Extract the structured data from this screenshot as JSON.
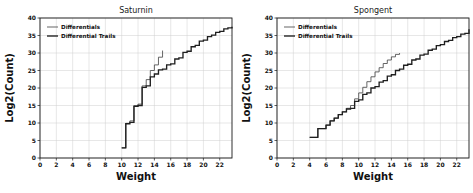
{
  "figure": {
    "background": "#ffffff",
    "line_color_differentials": "#4a4a4a",
    "line_color_trails": "#1f1f1f",
    "grid_color": "#cfcfcf"
  },
  "charts": [
    {
      "id": "saturnin",
      "title": "Saturnin",
      "xlabel": "Weight",
      "ylabel": "Log2(Count)",
      "legend": [
        "Differentials",
        "Differential Trails"
      ],
      "xticks": [
        0,
        2,
        4,
        6,
        8,
        10,
        12,
        14,
        16,
        18,
        20,
        22
      ],
      "yticks": [
        0,
        5,
        10,
        15,
        20,
        25,
        30,
        35,
        40
      ]
    },
    {
      "id": "spongent",
      "title": "Spongent",
      "xlabel": "Weight",
      "ylabel": "Log2(Count)",
      "legend": [
        "Differentials",
        "Differential Trails"
      ],
      "xticks": [
        0,
        2,
        4,
        6,
        8,
        10,
        12,
        14,
        16,
        18,
        20,
        22
      ],
      "yticks": [
        0,
        5,
        10,
        15,
        20,
        25,
        30,
        35,
        40
      ]
    }
  ],
  "chart_data": [
    {
      "type": "line",
      "id": "saturnin",
      "title": "Saturnin",
      "xlabel": "Weight",
      "ylabel": "Log2(Count)",
      "xlim": [
        0,
        23.5
      ],
      "ylim": [
        0,
        40
      ],
      "xticks": [
        0,
        2,
        4,
        6,
        8,
        10,
        12,
        14,
        16,
        18,
        20,
        22
      ],
      "yticks": [
        0,
        5,
        10,
        15,
        20,
        25,
        30,
        35,
        40
      ],
      "grid": true,
      "legend_position": "upper left",
      "drawstyle": "steps-post",
      "series": [
        {
          "name": "Differentials",
          "x": [
            10,
            10.5,
            11,
            11.5,
            12,
            12.5,
            13,
            13.5,
            14,
            14.5,
            15
          ],
          "y": [
            2.9,
            9.9,
            10.6,
            14.9,
            15.4,
            20.6,
            22.4,
            25.0,
            26.6,
            28.8,
            30.7
          ]
        },
        {
          "name": "Differential Trails",
          "x": [
            10,
            10.5,
            11,
            11.5,
            12,
            12.5,
            13,
            13.5,
            14,
            14.5,
            15,
            15.5,
            16,
            16.5,
            17,
            17.5,
            18,
            18.5,
            19,
            19.5,
            20,
            20.5,
            21,
            21.5,
            22,
            22.5,
            23,
            23.5
          ],
          "y": [
            2.9,
            9.8,
            10.2,
            14.8,
            15.0,
            20.2,
            20.6,
            23.2,
            24.0,
            25.2,
            25.4,
            26.6,
            26.9,
            28.3,
            28.6,
            30.2,
            30.5,
            31.8,
            32.2,
            33.4,
            33.7,
            34.7,
            35.1,
            35.9,
            36.2,
            36.9,
            37.2,
            37.5
          ]
        }
      ]
    },
    {
      "type": "line",
      "id": "spongent",
      "title": "Spongent",
      "xlabel": "Weight",
      "ylabel": "Log2(Count)",
      "xlim": [
        0,
        23.5
      ],
      "ylim": [
        0,
        40
      ],
      "xticks": [
        0,
        2,
        4,
        6,
        8,
        10,
        12,
        14,
        16,
        18,
        20,
        22
      ],
      "yticks": [
        0,
        5,
        10,
        15,
        20,
        25,
        30,
        35,
        40
      ],
      "grid": true,
      "legend_position": "upper left",
      "drawstyle": "steps-post",
      "series": [
        {
          "name": "Differentials",
          "x": [
            4,
            5,
            6,
            6.5,
            7,
            7.5,
            8,
            8.5,
            9,
            9.5,
            10,
            10.5,
            11,
            11.5,
            12,
            12.5,
            13,
            13.5,
            14,
            14.5,
            15
          ],
          "y": [
            5.9,
            8.4,
            9.4,
            10.6,
            11.4,
            12.4,
            13.2,
            14.2,
            15.0,
            16.9,
            18.6,
            20.2,
            21.8,
            23.2,
            24.6,
            25.8,
            27.0,
            28.0,
            28.9,
            29.6,
            30.0
          ]
        },
        {
          "name": "Differential Trails",
          "x": [
            4,
            5,
            6,
            6.5,
            7,
            7.5,
            8,
            8.5,
            9,
            9.5,
            10,
            10.5,
            11,
            11.5,
            12,
            12.5,
            13,
            13.5,
            14,
            14.5,
            15,
            15.5,
            16,
            16.5,
            17,
            17.5,
            18,
            18.5,
            19,
            19.5,
            20,
            20.5,
            21,
            21.5,
            22,
            22.5,
            23,
            23.5
          ],
          "y": [
            5.9,
            8.4,
            9.4,
            10.6,
            11.4,
            12.4,
            13.2,
            14.0,
            14.2,
            16.2,
            16.6,
            18.2,
            18.6,
            20.0,
            20.4,
            21.7,
            22.1,
            23.4,
            23.8,
            25.0,
            25.4,
            26.5,
            26.8,
            28.0,
            28.3,
            29.4,
            29.7,
            30.8,
            31.1,
            32.1,
            32.4,
            33.3,
            33.6,
            34.4,
            34.7,
            35.4,
            35.6,
            36.8
          ]
        }
      ]
    }
  ]
}
